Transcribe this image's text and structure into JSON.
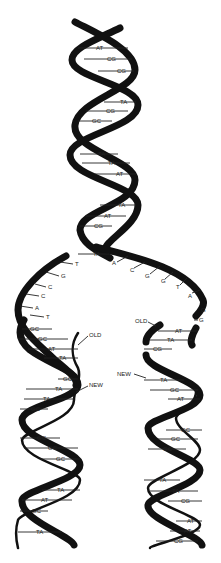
{
  "parent_helix": {
    "base_pairs": [
      {
        "label": "AT",
        "x": 96,
        "y": 48
      },
      {
        "label": "CG",
        "x": 107,
        "y": 59
      },
      {
        "label": "CG",
        "x": 117,
        "y": 71
      },
      {
        "label": "TA",
        "x": 124,
        "y": 102
      },
      {
        "label": "CG",
        "x": 110,
        "y": 111
      },
      {
        "label": "GC",
        "x": 96,
        "y": 121
      },
      {
        "label": "TA",
        "x": 100,
        "y": 154
      },
      {
        "label": "TA",
        "x": 110,
        "y": 163
      },
      {
        "label": "AT",
        "x": 118,
        "y": 174
      },
      {
        "label": "TA",
        "x": 122,
        "y": 205
      },
      {
        "label": "AT",
        "x": 107,
        "y": 216
      },
      {
        "label": "CG",
        "x": 97,
        "y": 226
      },
      {
        "label": "TA",
        "x": 96,
        "y": 254
      }
    ]
  },
  "fork": {
    "left_bases": [
      {
        "label": "T",
        "x": 75,
        "y": 264
      },
      {
        "label": "G",
        "x": 61,
        "y": 276
      },
      {
        "label": "C",
        "x": 48,
        "y": 287
      },
      {
        "label": "C",
        "x": 41,
        "y": 296
      },
      {
        "label": "A",
        "x": 35,
        "y": 308
      },
      {
        "label": "T",
        "x": 46,
        "y": 317
      }
    ],
    "right_bases": [
      {
        "label": "A",
        "x": 113,
        "y": 263
      },
      {
        "label": "C",
        "x": 131,
        "y": 270
      },
      {
        "label": "G",
        "x": 146,
        "y": 276
      },
      {
        "label": "G",
        "x": 162,
        "y": 281
      },
      {
        "label": "T",
        "x": 177,
        "y": 287
      },
      {
        "label": "A",
        "x": 190,
        "y": 296
      },
      {
        "label": "G",
        "x": 203,
        "y": 310
      },
      {
        "label": "G",
        "x": 196,
        "y": 320
      }
    ]
  },
  "left_daughter": {
    "labels": {
      "old": "OLD",
      "new": "NEW"
    },
    "old_label_pos": {
      "x": 88,
      "y": 337
    },
    "new_label_pos": {
      "x": 90,
      "y": 386
    },
    "base_pairs": [
      {
        "label": "GC",
        "x": 33,
        "y": 329
      },
      {
        "label": "GC",
        "x": 40,
        "y": 339
      },
      {
        "label": "AT",
        "x": 51,
        "y": 349
      },
      {
        "label": "TA",
        "x": 61,
        "y": 358
      },
      {
        "label": "GC",
        "x": 66,
        "y": 379
      },
      {
        "label": "TA",
        "x": 58,
        "y": 389
      },
      {
        "label": "TA",
        "x": 46,
        "y": 399
      },
      {
        "label": "GC",
        "x": 34,
        "y": 409
      },
      {
        "label": "GC",
        "x": 40,
        "y": 438
      },
      {
        "label": "GC",
        "x": 51,
        "y": 448
      },
      {
        "label": "GC",
        "x": 59,
        "y": 459
      },
      {
        "label": "TA",
        "x": 60,
        "y": 490
      },
      {
        "label": "AT",
        "x": 44,
        "y": 500
      },
      {
        "label": "GC",
        "x": 35,
        "y": 511
      },
      {
        "label": "TA",
        "x": 38,
        "y": 532
      }
    ]
  },
  "right_daughter": {
    "labels": {
      "old": "OLD",
      "new": "NEW"
    },
    "old_label_pos": {
      "x": 135,
      "y": 321
    },
    "new_label_pos": {
      "x": 117,
      "y": 374
    },
    "base_pairs": [
      {
        "label": "AT",
        "x": 178,
        "y": 331
      },
      {
        "label": "TA",
        "x": 170,
        "y": 340
      },
      {
        "label": "CG",
        "x": 156,
        "y": 349
      },
      {
        "label": "TA",
        "x": 163,
        "y": 380
      },
      {
        "label": "GC",
        "x": 173,
        "y": 390
      },
      {
        "label": "AT",
        "x": 180,
        "y": 399
      },
      {
        "label": "GC",
        "x": 184,
        "y": 430
      },
      {
        "label": "GC",
        "x": 174,
        "y": 439
      },
      {
        "label": "GC",
        "x": 170,
        "y": 449
      },
      {
        "label": "TA",
        "x": 162,
        "y": 450
      },
      {
        "label": "TA",
        "x": 164,
        "y": 480
      },
      {
        "label": "TA",
        "x": 176,
        "y": 491
      },
      {
        "label": "CG",
        "x": 184,
        "y": 501
      },
      {
        "label": "AT",
        "x": 190,
        "y": 521
      },
      {
        "label": "AT",
        "x": 188,
        "y": 531
      },
      {
        "label": "CG",
        "x": 178,
        "y": 541
      }
    ]
  },
  "colors": {
    "strand": "#111111",
    "background": "#ffffff",
    "text": "#222222"
  }
}
